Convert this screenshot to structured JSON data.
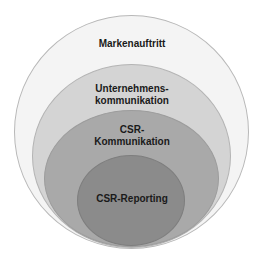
{
  "diagram": {
    "type": "nested-ellipses",
    "layers": [
      {
        "label": "Markenauftritt",
        "fill": "#f4f4f4",
        "stroke": "#b8b8b8"
      },
      {
        "label_line1": "Unternehmens-",
        "label_line2": "kommunikation",
        "fill": "#d4d4d4",
        "stroke": "#b0b0b0"
      },
      {
        "label_line1": "CSR-",
        "label_line2": "Kommunikation",
        "fill": "#a8a8a8",
        "stroke": "#999999"
      },
      {
        "label": "CSR-Reporting",
        "fill": "#8a8a8a",
        "stroke": "#7a7a7a"
      }
    ]
  }
}
